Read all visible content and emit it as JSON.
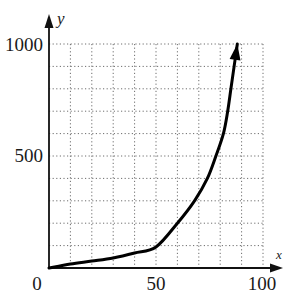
{
  "chart_data": {
    "type": "line",
    "title": "",
    "xlabel": "x",
    "ylabel": "y",
    "xlim": [
      0,
      100
    ],
    "ylim": [
      0,
      1000
    ],
    "x_ticks": [
      0,
      50,
      100
    ],
    "y_ticks": [
      0,
      500,
      1000
    ],
    "x_tick_labels": [
      "0",
      "50",
      "100"
    ],
    "y_tick_labels": [
      "0",
      "500",
      "1000"
    ],
    "grid": true,
    "grid_style": "dotted",
    "grid_x_step": 10,
    "grid_y_step": 100,
    "legend": null,
    "series": [
      {
        "name": "curve",
        "color": "#000000",
        "arrow_at_end": true,
        "x": [
          0,
          10,
          20,
          30,
          40,
          50,
          60,
          68,
          74,
          78,
          81.5,
          83.5,
          85,
          86.5,
          88
        ],
        "y": [
          0,
          18,
          31,
          45,
          67,
          94,
          200,
          300,
          400,
          500,
          600,
          700,
          800,
          900,
          1000
        ]
      }
    ]
  },
  "labels": {
    "y_axis_name": "y",
    "x_axis_name": "x",
    "origin": "0",
    "x_mid": "50",
    "x_max": "100",
    "y_mid": "500",
    "y_max": "1000"
  }
}
